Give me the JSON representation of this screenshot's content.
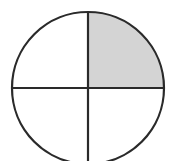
{
  "diagram": {
    "type": "fraction-circle",
    "total_parts": 4,
    "shaded_parts": 1,
    "shaded_quadrant": "top-right",
    "fraction": "1/4",
    "center": [
      88,
      88
    ],
    "radius": 76,
    "colors": {
      "stroke": "#2a2a2a",
      "shaded_fill": "#d4d4d4",
      "unshaded_fill": "#ffffff",
      "background": "#ffffff"
    },
    "stroke_width": 2.2
  }
}
